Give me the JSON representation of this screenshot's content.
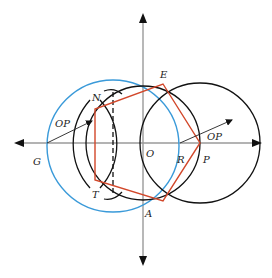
{
  "diagram": {
    "labels": {
      "N": "N",
      "E": "E",
      "OP_left": "OP",
      "OP_right": "OP",
      "G": "G",
      "O": "O",
      "R": "R",
      "P": "P",
      "T": "T",
      "A": "A"
    },
    "colors": {
      "axis": "#9a9a9a",
      "blue_circle": "#3a9ad9",
      "black_circle": "#111111",
      "pentagon": "#d2472a",
      "radius_line": "#222222"
    },
    "points": {
      "O": [
        143,
        143
      ],
      "P": [
        200,
        143
      ],
      "E": [
        163,
        84
      ],
      "A": [
        163,
        201
      ],
      "N": [
        95,
        109
      ],
      "T": [
        95,
        180
      ],
      "G": [
        47,
        143
      ],
      "R": [
        180,
        143
      ]
    }
  }
}
